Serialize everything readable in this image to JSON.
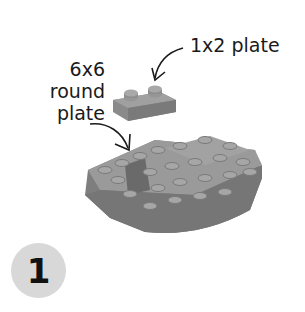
{
  "labels": {
    "part_1x2": "1x2 plate",
    "part_6x6_line1": "6x6",
    "part_6x6_line2": "round",
    "part_6x6_line3": "plate"
  },
  "step": {
    "number": "1"
  },
  "colors": {
    "brick": "#8a8a8a",
    "brick_dark": "#6e6e6e",
    "brick_light": "#a4a4a4",
    "badge": "#d8d8d8",
    "ink": "#1a1a1a"
  }
}
